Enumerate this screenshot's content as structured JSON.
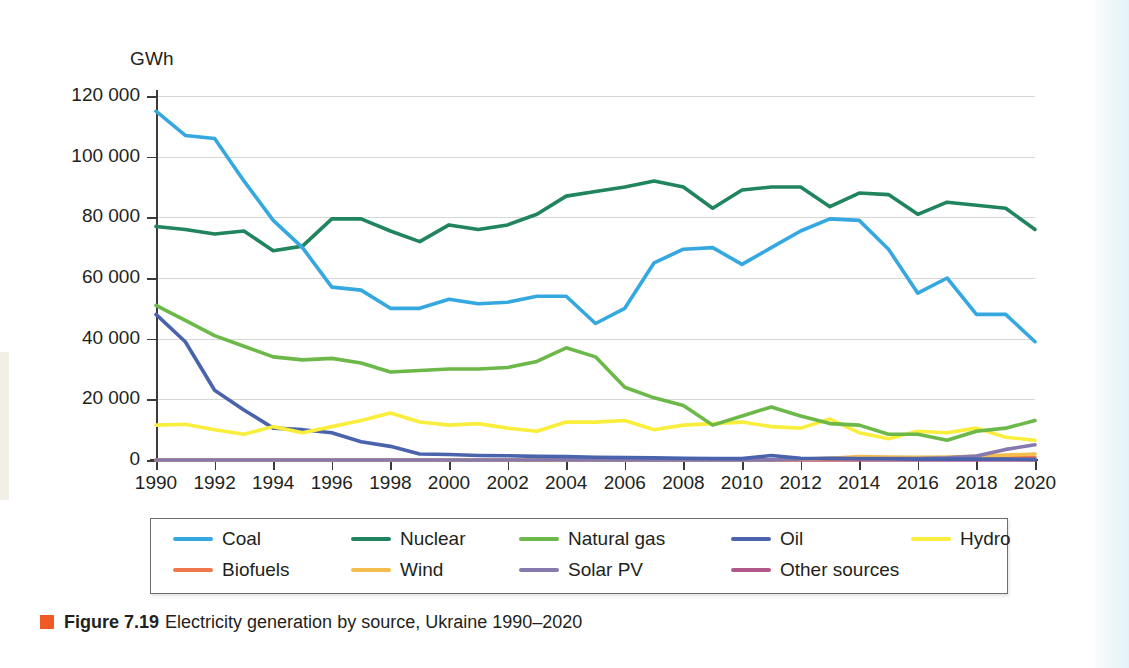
{
  "figure": {
    "bullet_color": "#f15a24",
    "number_label": "Figure 7.19",
    "caption": "Electricity generation by source, Ukraine 1990–2020"
  },
  "chart_data": {
    "type": "line",
    "title": "",
    "unit_label": "GWh",
    "xlabel": "",
    "ylabel": "GWh",
    "grid": true,
    "legend_position": "bottom",
    "xlim": [
      1990,
      2020
    ],
    "ylim": [
      0,
      120000
    ],
    "yticks": [
      0,
      20000,
      40000,
      60000,
      80000,
      100000,
      120000
    ],
    "ytick_labels": [
      "0",
      "20 000",
      "40 000",
      "60 000",
      "80 000",
      "100 000",
      "120 000"
    ],
    "xticks": [
      1990,
      1992,
      1994,
      1996,
      1998,
      2000,
      2002,
      2004,
      2006,
      2008,
      2010,
      2012,
      2014,
      2016,
      2018,
      2020
    ],
    "xtick_labels": [
      "1990",
      "1992",
      "1994",
      "1996",
      "1998",
      "2000",
      "2002",
      "2004",
      "2006",
      "2008",
      "2010",
      "2012",
      "2014",
      "2016",
      "2018",
      "2020"
    ],
    "x": [
      1990,
      1991,
      1992,
      1993,
      1994,
      1995,
      1996,
      1997,
      1998,
      1999,
      2000,
      2001,
      2002,
      2003,
      2004,
      2005,
      2006,
      2007,
      2008,
      2009,
      2010,
      2011,
      2012,
      2013,
      2014,
      2015,
      2016,
      2017,
      2018,
      2019,
      2020
    ],
    "series": [
      {
        "name": "Coal",
        "color": "#35a8e0",
        "values": [
          115000,
          107000,
          106000,
          92000,
          79000,
          70000,
          57000,
          56000,
          50000,
          50000,
          53000,
          51500,
          52000,
          54000,
          54000,
          45000,
          50000,
          65000,
          69500,
          70000,
          64500,
          70000,
          75500,
          79500,
          79000,
          69500,
          55000,
          60000,
          48000,
          48000,
          39000
        ]
      },
      {
        "name": "Nuclear",
        "color": "#20855f",
        "values": [
          77000,
          76000,
          74500,
          75500,
          69000,
          70500,
          79500,
          79500,
          75500,
          72000,
          77500,
          76000,
          77500,
          81000,
          87000,
          88500,
          90000,
          92000,
          90000,
          83000,
          89000,
          90000,
          90000,
          83500,
          88000,
          87500,
          81000,
          85000,
          84000,
          83000,
          76000
        ]
      },
      {
        "name": "Natural gas",
        "color": "#6cb849",
        "values": [
          51000,
          46000,
          41000,
          37500,
          34000,
          33000,
          33500,
          32000,
          29000,
          29500,
          30000,
          30000,
          30500,
          32500,
          37000,
          34000,
          24000,
          20500,
          18000,
          11500,
          14500,
          17500,
          14500,
          12000,
          11500,
          8500,
          8500,
          6500,
          9500,
          10500,
          13000
        ]
      },
      {
        "name": "Oil",
        "color": "#4a63ad",
        "values": [
          48000,
          39000,
          23000,
          16500,
          10500,
          10000,
          9000,
          6000,
          4500,
          2000,
          1800,
          1500,
          1400,
          1200,
          1100,
          900,
          800,
          700,
          600,
          500,
          450,
          1500,
          600,
          500,
          400,
          400,
          300,
          300,
          300,
          300,
          200
        ]
      },
      {
        "name": "Hydro",
        "color": "#faee3c",
        "values": [
          11500,
          11800,
          10000,
          8500,
          11000,
          9000,
          11000,
          13000,
          15500,
          12500,
          11500,
          12000,
          10500,
          9500,
          12500,
          12500,
          13000,
          10000,
          11500,
          12000,
          12500,
          11000,
          10500,
          13500,
          9000,
          7000,
          9500,
          9000,
          10500,
          7500,
          6500
        ]
      },
      {
        "name": "Biofuels",
        "color": "#f0774b",
        "values": [
          0,
          0,
          0,
          0,
          0,
          0,
          0,
          0,
          0,
          0,
          0,
          0,
          0,
          0,
          0,
          0,
          0,
          0,
          0,
          0,
          0,
          100,
          150,
          200,
          250,
          300,
          400,
          500,
          600,
          800,
          900
        ]
      },
      {
        "name": "Wind",
        "color": "#f5bc4e",
        "values": [
          0,
          0,
          0,
          0,
          0,
          0,
          0,
          0,
          0,
          0,
          0,
          0,
          0,
          0,
          0,
          0,
          0,
          0,
          0,
          0,
          50,
          100,
          250,
          600,
          1100,
          1000,
          900,
          1000,
          1200,
          1600,
          2000
        ]
      },
      {
        "name": "Solar PV",
        "color": "#8579ad",
        "values": [
          0,
          0,
          0,
          0,
          0,
          0,
          0,
          0,
          0,
          0,
          0,
          0,
          0,
          0,
          0,
          0,
          0,
          0,
          0,
          0,
          0,
          50,
          350,
          600,
          500,
          450,
          500,
          700,
          1300,
          3500,
          5000
        ]
      },
      {
        "name": "Other sources",
        "color": "#b0588a",
        "values": [
          0,
          0,
          0,
          0,
          0,
          0,
          0,
          0,
          0,
          0,
          0,
          0,
          0,
          0,
          0,
          0,
          0,
          0,
          0,
          0,
          0,
          0,
          0,
          0,
          0,
          0,
          0,
          0,
          0,
          0,
          0
        ]
      }
    ]
  },
  "legend": {
    "row1": [
      "Coal",
      "Nuclear",
      "Natural gas",
      "Oil",
      "Hydro"
    ],
    "row2": [
      "Biofuels",
      "Wind",
      "Solar PV",
      "Other sources"
    ]
  }
}
